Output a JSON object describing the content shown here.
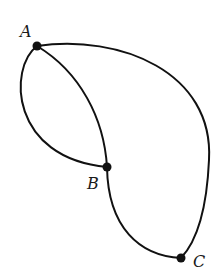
{
  "diagram": {
    "type": "graph",
    "vertices": [
      {
        "id": "A",
        "label": "A",
        "x": 37,
        "y": 46
      },
      {
        "id": "B",
        "label": "B",
        "x": 107,
        "y": 167
      },
      {
        "id": "C",
        "label": "C",
        "x": 181,
        "y": 258
      }
    ],
    "edges": [
      {
        "id": "e1",
        "from": "A",
        "to": "B",
        "shape": "left-bulging arc"
      },
      {
        "id": "e2",
        "from": "A",
        "to": "B",
        "shape": "gentle right-bulging arc"
      },
      {
        "id": "e3",
        "from": "B",
        "to": "C",
        "shape": "downward arc"
      },
      {
        "id": "e4",
        "from": "A",
        "to": "C",
        "shape": "large outer arc"
      }
    ],
    "colors": {
      "stroke": "#111111",
      "background": "#ffffff"
    }
  }
}
